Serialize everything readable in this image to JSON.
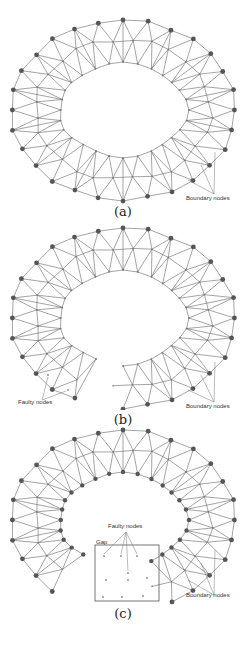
{
  "figure": {
    "panels": [
      {
        "id": "a",
        "caption": "(a)",
        "variant": "full-ring",
        "labels": {
          "boundary": "Boundary nodes"
        }
      },
      {
        "id": "b",
        "caption": "(b)",
        "variant": "faulty-isolated",
        "labels": {
          "boundary": "Boundary nodes",
          "faulty": "Faulty nodes"
        }
      },
      {
        "id": "c",
        "caption": "(c)",
        "variant": "gap",
        "labels": {
          "boundary": "Boundary nodes",
          "faulty": "Faulty nodes",
          "gap": "Gap"
        }
      }
    ],
    "colors": {
      "edge": "#666666",
      "boundary_node": "#555555",
      "inner_node": "#777777",
      "faulty_node": "#888888",
      "gap_box": "#555555"
    }
  }
}
